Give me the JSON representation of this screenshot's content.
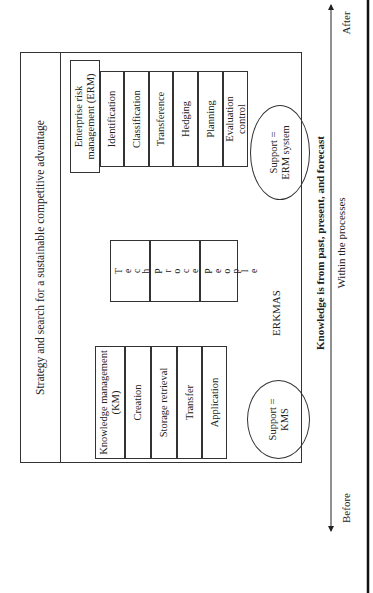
{
  "title": "Strategy and search for a sustainable competitive advantage",
  "center_label": "ERKMAS",
  "erm": {
    "header": "Enterprise risk management (ERM)",
    "processes": [
      "Identification",
      "Classification",
      "Transference",
      "Hedging",
      "Planning",
      "Evaluation control"
    ],
    "support": "Support = ERM system"
  },
  "km": {
    "header": "Knowledge management (KM)",
    "processes": [
      "Creation",
      "Storage retrieval",
      "Transfer",
      "Application"
    ],
    "support": "Support = KMS"
  },
  "core": {
    "rows": [
      {
        "label": "Technology",
        "letters": [
          "T",
          "e",
          "c",
          "h",
          "n",
          "o",
          "l",
          "o",
          "g",
          "y"
        ]
      },
      {
        "label": "Processes",
        "letters": [
          "P",
          "r",
          "o",
          "c",
          "e",
          "s",
          "s",
          "e",
          "s"
        ]
      },
      {
        "label": "People",
        "letters": [
          "P",
          "e",
          "o",
          "p",
          "l",
          "e"
        ]
      }
    ]
  },
  "timeline": {
    "bold_label": "Knowledge is from past, present, and forecast",
    "sub_label": "Within the processes",
    "start": "Before",
    "end": "After"
  }
}
